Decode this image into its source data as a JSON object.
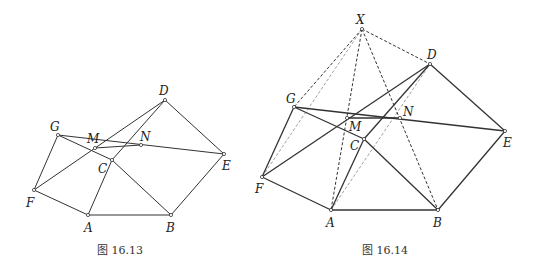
{
  "figures": [
    {
      "id": "fig-16-13",
      "caption": "图 16.13",
      "caption_pos": [
        120,
        254
      ],
      "points": {
        "A": [
          88,
          215
        ],
        "B": [
          171,
          215
        ],
        "C": [
          112,
          160
        ],
        "D": [
          165,
          100
        ],
        "E": [
          224,
          154
        ],
        "F": [
          34,
          190
        ],
        "G": [
          58,
          135
        ],
        "M": [
          95,
          148
        ],
        "N": [
          141,
          145
        ]
      },
      "labels": {
        "A": [
          84,
          232
        ],
        "B": [
          166,
          232
        ],
        "C": [
          98,
          173
        ],
        "D": [
          159,
          95
        ],
        "E": [
          222,
          170
        ],
        "F": [
          26,
          207
        ],
        "G": [
          50,
          131
        ],
        "M": [
          87,
          143
        ],
        "N": [
          140,
          141
        ]
      },
      "solid_segments": [
        [
          "A",
          "B"
        ],
        [
          "B",
          "E"
        ],
        [
          "E",
          "D"
        ],
        [
          "D",
          "C"
        ],
        [
          "C",
          "A"
        ],
        [
          "C",
          "B"
        ],
        [
          "A",
          "F"
        ],
        [
          "F",
          "G"
        ],
        [
          "G",
          "E"
        ],
        [
          "G",
          "C"
        ],
        [
          "F",
          "D"
        ],
        [
          "M",
          "N"
        ]
      ],
      "dashed_segments": [],
      "light_dashed_segments": []
    },
    {
      "id": "fig-16-14",
      "caption": "图 16.14",
      "caption_pos": [
        385,
        254
      ],
      "points": {
        "X": [
          362,
          29
        ],
        "A": [
          331,
          210
        ],
        "B": [
          438,
          210
        ],
        "C": [
          364,
          139
        ],
        "D": [
          430,
          64
        ],
        "E": [
          505,
          131
        ],
        "F": [
          262,
          177
        ],
        "G": [
          294,
          107
        ],
        "M": [
          347,
          118
        ],
        "N": [
          400,
          118
        ]
      },
      "labels": {
        "X": [
          356,
          24
        ],
        "A": [
          326,
          227
        ],
        "B": [
          433,
          227
        ],
        "C": [
          350,
          150
        ],
        "D": [
          427,
          59
        ],
        "E": [
          503,
          147
        ],
        "F": [
          255,
          193
        ],
        "G": [
          286,
          103
        ],
        "M": [
          349,
          131
        ],
        "N": [
          403,
          116
        ]
      },
      "solid_segments": [
        [
          "A",
          "B"
        ],
        [
          "B",
          "E"
        ],
        [
          "E",
          "D"
        ],
        [
          "D",
          "C"
        ],
        [
          "C",
          "A"
        ],
        [
          "C",
          "B"
        ],
        [
          "A",
          "F"
        ],
        [
          "F",
          "G"
        ],
        [
          "G",
          "E"
        ],
        [
          "G",
          "C"
        ],
        [
          "F",
          "D"
        ],
        [
          "M",
          "N"
        ]
      ],
      "dashed_segments": [
        [
          "X",
          "G"
        ],
        [
          "X",
          "D"
        ],
        [
          "X",
          "A"
        ],
        [
          "X",
          "B"
        ]
      ],
      "light_dashed_segments": [
        [
          "X",
          "F"
        ],
        [
          "A",
          "D"
        ]
      ]
    }
  ],
  "colors": {
    "line": "#333333",
    "light_line": "#888888",
    "point_fill": "#ffffff"
  }
}
